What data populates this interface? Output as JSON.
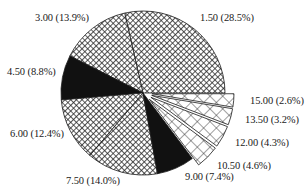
{
  "chart_data": {
    "type": "pie",
    "title": "",
    "start_angle_deg": 0,
    "direction": "counterclockwise",
    "slices": [
      {
        "label": "1.50",
        "percent": 28.5,
        "display": "1.50 (28.5%)",
        "fill": "crosshatch-fine",
        "exploded": false
      },
      {
        "label": "3.00",
        "percent": 13.9,
        "display": "3.00 (13.9%)",
        "fill": "crosshatch-fine",
        "exploded": false
      },
      {
        "label": "4.50",
        "percent": 8.8,
        "display": "4.50 (8.8%)",
        "fill": "solid-black",
        "exploded": false
      },
      {
        "label": "6.00",
        "percent": 12.4,
        "display": "6.00 (12.4%)",
        "fill": "crosshatch-fine",
        "exploded": false
      },
      {
        "label": "7.50",
        "percent": 14.0,
        "display": "7.50 (14.0%)",
        "fill": "crosshatch-fine",
        "exploded": false
      },
      {
        "label": "9.00",
        "percent": 7.4,
        "display": "9.00 (7.4%)",
        "fill": "solid-black",
        "exploded": false
      },
      {
        "label": "10.50",
        "percent": 4.6,
        "display": "10.50 (4.6%)",
        "fill": "crosshatch-coarse",
        "exploded": true
      },
      {
        "label": "12.00",
        "percent": 4.3,
        "display": "12.00 (4.3%)",
        "fill": "crosshatch-coarse",
        "exploded": true
      },
      {
        "label": "13.50",
        "percent": 3.2,
        "display": "13.50 (3.2%)",
        "fill": "crosshatch-coarse",
        "exploded": true
      },
      {
        "label": "15.00",
        "percent": 2.6,
        "display": "15.00 (2.6%)",
        "fill": "crosshatch-coarse",
        "exploded": true
      }
    ],
    "legend": "none",
    "labels_position": "outside"
  },
  "labels": {
    "l0": "1.50 (28.5%)",
    "l1": "3.00 (13.9%)",
    "l2": "4.50 (8.8%)",
    "l3": "6.00 (12.4%)",
    "l4": "7.50 (14.0%)",
    "l5": "9.00 (7.4%)",
    "l6": "10.50 (4.6%)",
    "l7": "12.00 (4.3%)",
    "l8": "13.50 (3.2%)",
    "l9": "15.00 (2.6%)"
  },
  "colors": {
    "ink": "#1a1a1a",
    "background": "#ffffff"
  }
}
